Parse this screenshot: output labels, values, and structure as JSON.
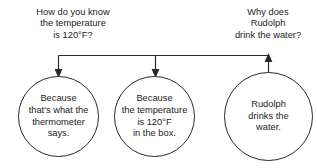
{
  "diagram": {
    "type": "flow-diagram",
    "line_color": "#2a2a2a",
    "text_color": "#1c1c1c",
    "background": "#ffffff",
    "questions": [
      {
        "id": "question-temperature",
        "lines": [
          "How do you know",
          "the temperature",
          "is 120°F?"
        ]
      },
      {
        "id": "question-rudolph",
        "lines": [
          "Why does",
          "Rudolph",
          "drink the water?"
        ]
      }
    ],
    "answers": [
      {
        "id": "answer-thermometer",
        "lines": [
          "Because",
          "that's what the",
          "thermometer",
          "says."
        ]
      },
      {
        "id": "answer-temperature-box",
        "lines": [
          "Because",
          "the temperature",
          "is 120°F",
          "in the box."
        ]
      },
      {
        "id": "answer-rudolph-drinks",
        "lines": [
          "Rudolph",
          "drinks the",
          "water."
        ]
      }
    ],
    "connectors": [
      {
        "id": "arrow-to-thermometer",
        "direction": "down"
      },
      {
        "id": "arrow-to-temperature-box",
        "direction": "down"
      },
      {
        "id": "arrow-to-rudolph-question",
        "direction": "up"
      }
    ]
  }
}
